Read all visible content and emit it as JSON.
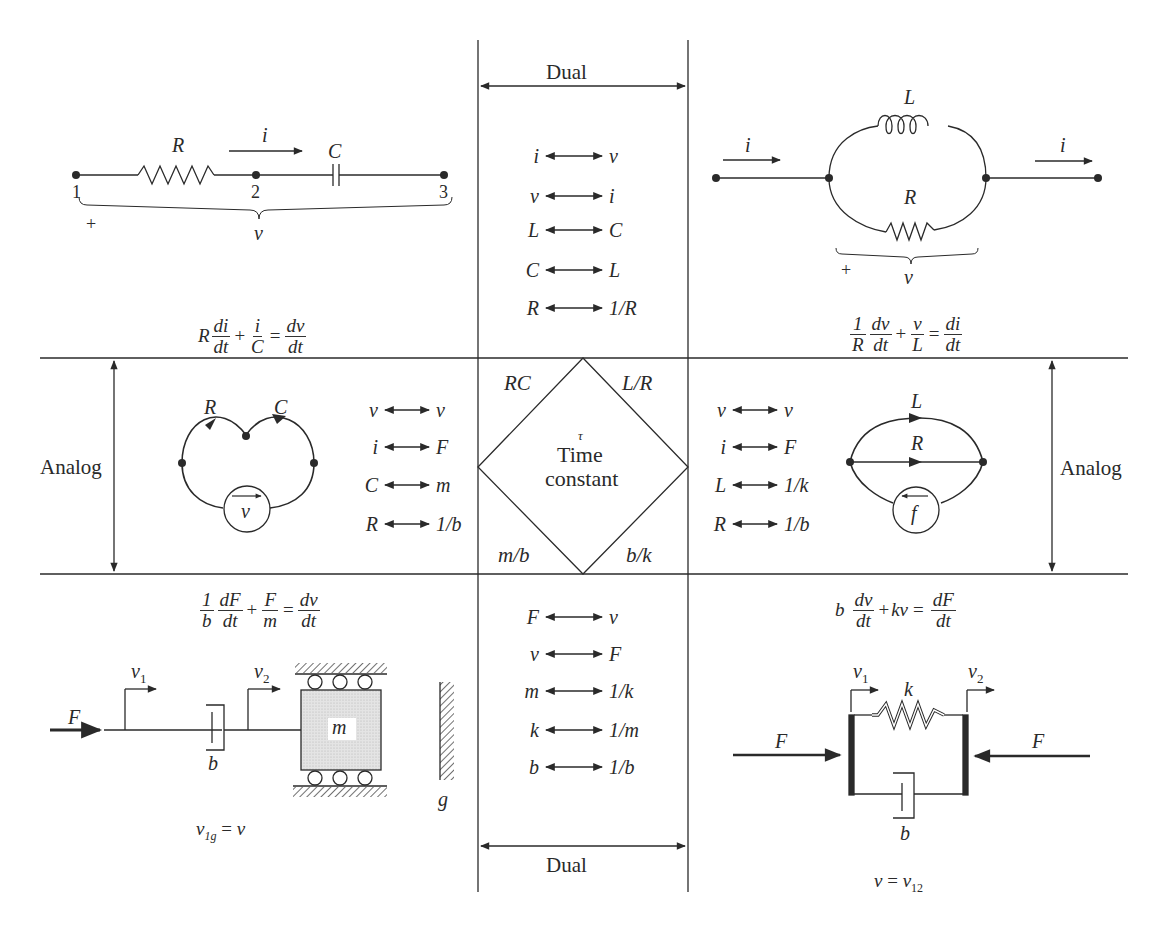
{
  "header": {
    "dual_top": "Dual",
    "dual_bottom": "Dual",
    "analog_left": "Analog",
    "analog_right": "Analog"
  },
  "center": {
    "tau": "τ",
    "title_line1": "Time",
    "title_line2": "constant",
    "corners": {
      "top_left": "RC",
      "top_right": "L/R",
      "bottom_left": "m/b",
      "bottom_right": "b/k"
    }
  },
  "dual_top_pairs": [
    {
      "left": "i",
      "right": "v"
    },
    {
      "left": "v",
      "right": "i"
    },
    {
      "left": "L",
      "right": "C"
    },
    {
      "left": "C",
      "right": "L"
    },
    {
      "left": "R",
      "right": "1/R"
    }
  ],
  "dual_bottom_pairs": [
    {
      "left": "F",
      "right": "v"
    },
    {
      "left": "v",
      "right": "F"
    },
    {
      "left": "m",
      "right": "1/k"
    },
    {
      "left": "k",
      "right": "1/m"
    },
    {
      "left": "b",
      "right": "1/b"
    }
  ],
  "analog_left_pairs": [
    {
      "left": "v",
      "right": "v"
    },
    {
      "left": "i",
      "right": "F"
    },
    {
      "left": "C",
      "right": "m"
    },
    {
      "left": "R",
      "right": "1/b"
    }
  ],
  "analog_right_pairs": [
    {
      "left": "v",
      "right": "v"
    },
    {
      "left": "i",
      "right": "F"
    },
    {
      "left": "L",
      "right": "1/k"
    },
    {
      "left": "R",
      "right": "1/b"
    }
  ],
  "series_rc": {
    "resistor_label": "R",
    "capacitor_label": "C",
    "current_label": "i",
    "nodes": [
      "1",
      "2",
      "3"
    ],
    "plus_sign": "+",
    "voltage_label": "v",
    "equation": {
      "t1_coef": "R",
      "t1_num": "di",
      "t1_den": "dt",
      "plus": "+",
      "t2_num": "i",
      "t2_den": "C",
      "equals": "=",
      "rhs_num": "dv",
      "rhs_den": "dt"
    }
  },
  "parallel_rl": {
    "inductor_label": "L",
    "resistor_label": "R",
    "current_in_label": "i",
    "current_out_label": "i",
    "plus_sign": "+",
    "voltage_label": "v",
    "equation": {
      "t1_num": "1",
      "t1_den": "R",
      "t1b_num": "dv",
      "t1b_den": "dt",
      "plus": "+",
      "t2_num": "v",
      "t2_den": "L",
      "equals": "=",
      "rhs_num": "di",
      "rhs_den": "dt"
    }
  },
  "linear_graph_left": {
    "edge1_label": "R",
    "edge2_label": "C",
    "source_label": "v"
  },
  "linear_graph_right": {
    "edge1_label": "L",
    "edge2_label": "R",
    "source_label": "f"
  },
  "mass_damper": {
    "force_label": "F",
    "v1_label": "v",
    "v1_sub": "1",
    "v2_label": "v",
    "v2_sub": "2",
    "damper_label": "b",
    "mass_label": "m",
    "ground_label": "g",
    "equation": {
      "t1_num": "1",
      "t1_den": "b",
      "t1b_num": "dF",
      "t1b_den": "dt",
      "plus": "+",
      "t2_num": "F",
      "t2_den": "m",
      "equals": "=",
      "rhs_num": "dv",
      "rhs_den": "dt"
    },
    "relation": {
      "lhs": "v",
      "lhs_sub": "1g",
      "equals": "=",
      "rhs": "v"
    }
  },
  "spring_damper": {
    "force_left_label": "F",
    "force_right_label": "F",
    "v1_label": "v",
    "v1_sub": "1",
    "v2_label": "v",
    "v2_sub": "2",
    "spring_label": "k",
    "damper_label": "b",
    "equation": {
      "t1_coef": "b",
      "t1_num": "dv",
      "t1_den": "dt",
      "plus": "+",
      "t2": "kv",
      "equals": "=",
      "rhs_num": "dF",
      "rhs_den": "dt"
    },
    "relation": {
      "lhs": "v",
      "equals": "=",
      "rhs": "v",
      "rhs_sub": "12"
    }
  },
  "colors": {
    "ink": "#2a2a2a",
    "paper": "#ffffff",
    "mass_fill": "#d9d9d9"
  }
}
